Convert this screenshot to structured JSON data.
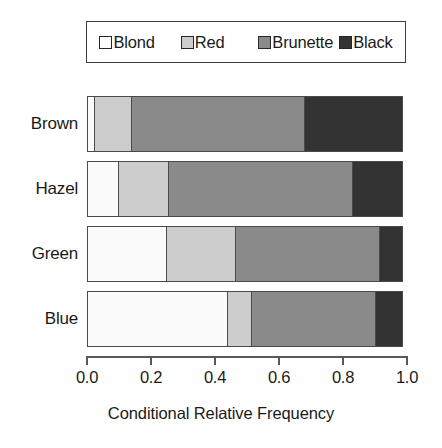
{
  "chart_data": {
    "type": "bar",
    "orientation": "horizontal",
    "stacked": true,
    "normalized": true,
    "title": "",
    "xlabel": "Conditional Relative Frequency",
    "ylabel": "",
    "xlim": [
      0.0,
      1.0
    ],
    "grid": false,
    "legend_position": "top",
    "categories": [
      "Brown",
      "Hazel",
      "Green",
      "Blue"
    ],
    "xticks": [
      "0.0",
      "0.2",
      "0.4",
      "0.6",
      "0.8",
      "1.0"
    ],
    "xtick_values": [
      0.0,
      0.2,
      0.4,
      0.6,
      0.8,
      1.0
    ],
    "series": [
      {
        "name": "Blond",
        "color": "#fbfbfb",
        "values": [
          0.025,
          0.1,
          0.25,
          0.44
        ]
      },
      {
        "name": "Red",
        "color": "#cdcdcd",
        "values": [
          0.12,
          0.16,
          0.22,
          0.08
        ]
      },
      {
        "name": "Brunette",
        "color": "#8a8a8a",
        "values": [
          0.545,
          0.58,
          0.455,
          0.39
        ]
      },
      {
        "name": "Black",
        "color": "#333333",
        "values": [
          0.31,
          0.16,
          0.075,
          0.09
        ]
      }
    ]
  },
  "legend": {
    "entries": [
      {
        "label": "Blond",
        "color": "#fbfbfb"
      },
      {
        "label": "Red",
        "color": "#cdcdcd"
      },
      {
        "label": "Brunette",
        "color": "#8a8a8a"
      },
      {
        "label": "Black",
        "color": "#333333"
      }
    ]
  },
  "axis": {
    "title": "Conditional Relative Frequency",
    "ticks": [
      "0.0",
      "0.2",
      "0.4",
      "0.6",
      "0.8",
      "1.0"
    ]
  },
  "categories": {
    "items": [
      "Brown",
      "Hazel",
      "Green",
      "Blue"
    ]
  }
}
